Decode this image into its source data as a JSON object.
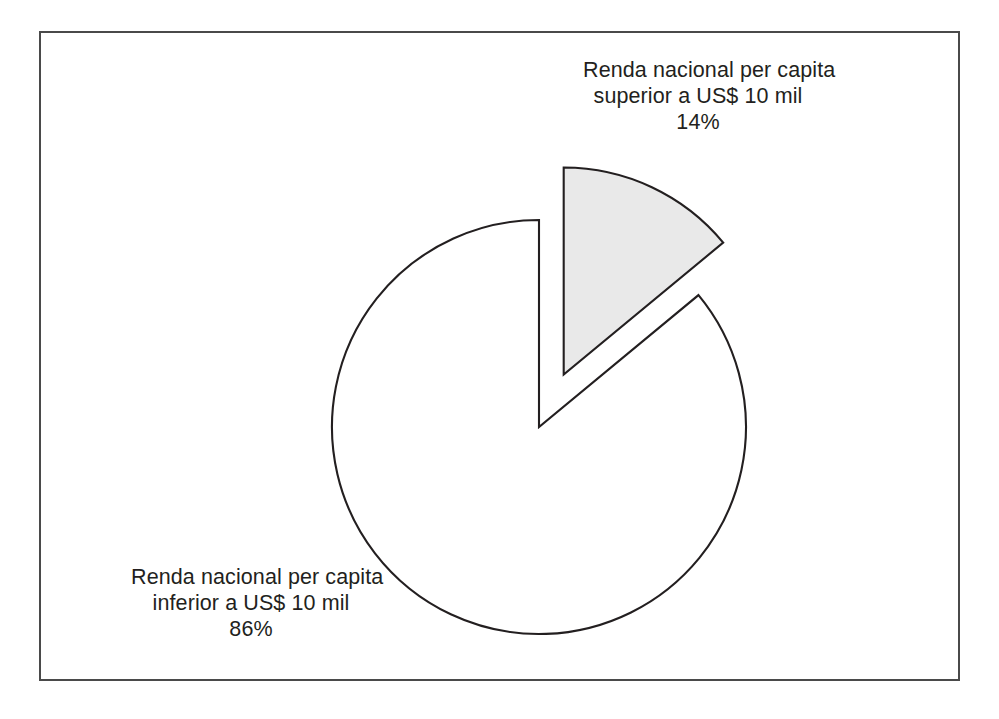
{
  "figure": {
    "background_color": "#ffffff",
    "frame_border_color": "#4a4a4a"
  },
  "chart_data": {
    "type": "pie",
    "title": "",
    "subtitle": "",
    "xlabel": "",
    "ylabel": "",
    "legend_position": "none",
    "grid": false,
    "start_angle_deg": 0,
    "direction": "clockwise",
    "categories": [
      "Renda nacional per capita superior a US$ 10 mil",
      "Renda nacional per capita inferior a US$ 10 mil"
    ],
    "values": [
      14,
      86
    ],
    "value_unit": "%",
    "slices": [
      {
        "label_line1": "Renda nacional per capita",
        "label_line2": "superior a US$ 10 mil",
        "value": 14,
        "value_text": "14%",
        "fill_color": "#e9e9e9",
        "stroke_color": "#231f20",
        "exploded": true
      },
      {
        "label_line1": "Renda nacional per capita",
        "label_line2": "inferior a US$ 10 mil",
        "value": 86,
        "value_text": "86%",
        "fill_color": "#ffffff",
        "stroke_color": "#231f20",
        "exploded": false
      }
    ]
  },
  "labels": {
    "superior": {
      "line1": "Renda nacional per capita",
      "line2": "superior a US$ 10 mil",
      "percent": "14%"
    },
    "inferior": {
      "line1": "Renda nacional per capita",
      "line2": "inferior a US$ 10 mil",
      "percent": "86%"
    }
  }
}
